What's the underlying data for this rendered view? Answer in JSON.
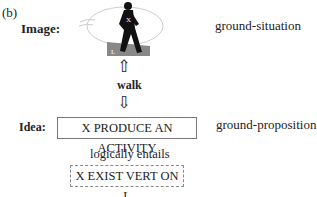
{
  "panel_label": "(b)",
  "image": {
    "label": "Image:",
    "right_label": "ground-situation",
    "figure_icon": "walking-person-in-eye",
    "ground_letter": "L",
    "figure_letter": "X"
  },
  "middle": {
    "word": "walk",
    "up_arrow": "⇧",
    "down_arrow": "⇩"
  },
  "idea": {
    "label": "Idea:",
    "box_text": "X PRODUCE AN ACTIVITY",
    "right_label": "ground-proposition",
    "relation": "logically entails",
    "entailed_text": "X EXIST VERT ON L"
  }
}
